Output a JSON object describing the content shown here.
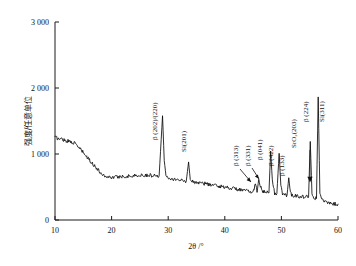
{
  "figure": {
    "name": "xrd-diffraction-pattern",
    "background": "#ffffff",
    "trace_color": "#0b0b0b"
  },
  "chart_data": {
    "type": "line",
    "title": "",
    "subtitle": "",
    "xlabel": "2θ /°",
    "ylabel": "强度/任意单位",
    "xlim": [
      10,
      60
    ],
    "ylim": [
      0,
      3000
    ],
    "grid": false,
    "legend": "none",
    "xticks": [
      10,
      20,
      30,
      40,
      50,
      60
    ],
    "xticklabels": [
      "10",
      "20",
      "30",
      "40",
      "50",
      "60"
    ],
    "yticks": [
      0,
      1000,
      2000,
      3000
    ],
    "yticklabels": [
      "0",
      "1 000",
      "2 000",
      "3 000"
    ],
    "series": [
      {
        "name": "XRD intensity",
        "x": [
          10.0,
          10.4,
          10.8,
          11.2,
          11.6,
          12.0,
          12.4,
          12.8,
          13.2,
          13.6,
          14.0,
          14.4,
          14.8,
          15.2,
          15.6,
          16.0,
          16.4,
          16.8,
          17.2,
          17.6,
          18.0,
          18.4,
          18.8,
          19.2,
          19.6,
          20.0,
          20.6,
          21.2,
          21.8,
          22.4,
          23.0,
          23.6,
          24.2,
          24.8,
          25.4,
          26.0,
          26.6,
          27.2,
          27.8,
          28.4,
          29.0,
          29.3,
          29.6,
          30.2,
          30.8,
          31.4,
          32.0,
          32.6,
          33.2,
          33.6,
          33.9,
          34.2,
          34.8,
          35.4,
          36.0,
          36.6,
          37.2,
          37.8,
          38.4,
          39.0,
          39.6,
          40.2,
          40.8,
          41.4,
          42.0,
          42.6,
          43.2,
          43.8,
          44.4,
          45.0,
          45.4,
          45.7,
          46.0,
          46.3,
          46.6,
          47.0,
          47.4,
          47.8,
          48.1,
          48.4,
          48.8,
          49.2,
          49.6,
          49.9,
          50.2,
          50.6,
          51.0,
          51.3,
          51.6,
          52.0,
          52.6,
          53.2,
          53.8,
          54.4,
          54.8,
          55.1,
          55.4,
          55.8,
          56.2,
          56.5,
          56.8,
          57.2,
          57.8,
          58.4,
          59.0,
          59.6,
          60.0
        ],
        "y": [
          1255,
          1240,
          1225,
          1230,
          1215,
          1200,
          1195,
          1185,
          1175,
          1150,
          1120,
          1080,
          1040,
          1000,
          955,
          915,
          880,
          840,
          800,
          760,
          720,
          690,
          670,
          655,
          650,
          648,
          650,
          655,
          660,
          662,
          665,
          668,
          672,
          675,
          678,
          680,
          678,
          675,
          672,
          670,
          1580,
          900,
          680,
          640,
          625,
          615,
          605,
          598,
          592,
          880,
          610,
          585,
          575,
          565,
          558,
          550,
          540,
          530,
          520,
          512,
          505,
          498,
          490,
          480,
          470,
          460,
          450,
          440,
          432,
          425,
          540,
          435,
          600,
          520,
          430,
          420,
          415,
          410,
          1045,
          600,
          405,
          400,
          1010,
          520,
          390,
          382,
          378,
          640,
          400,
          372,
          365,
          360,
          355,
          350,
          345,
          1190,
          420,
          330,
          325,
          1865,
          420,
          300,
          270,
          258,
          250,
          245,
          240
        ]
      }
    ],
    "annotations": [
      {
        "id": "beta-202-220",
        "label": "β (202)/(220)",
        "x": 29.0,
        "rotated": true
      },
      {
        "id": "si-201",
        "label": "Si(201)",
        "x": 33.9,
        "rotated": true
      },
      {
        "id": "beta-313",
        "label": "β (313)",
        "x": 45.4,
        "rotated": true
      },
      {
        "id": "beta-331",
        "label": "β (331)",
        "x": 46.0,
        "rotated": true
      },
      {
        "id": "beta-041",
        "label": "β (041)",
        "x": 48.1,
        "rotated": true
      },
      {
        "id": "beta-422",
        "label": "β (422)",
        "x": 49.6,
        "rotated": true
      },
      {
        "id": "beta-133",
        "label": "β (133)",
        "x": 51.3,
        "rotated": true
      },
      {
        "id": "sro2-203",
        "label": "SrO₂(203)",
        "x": 55.1,
        "rotated": true
      },
      {
        "id": "beta-224",
        "label": "β (224)",
        "x": 56.0,
        "rotated": true
      },
      {
        "id": "si-311",
        "label": "Si(311)",
        "x": 56.5,
        "rotated": true
      }
    ]
  }
}
